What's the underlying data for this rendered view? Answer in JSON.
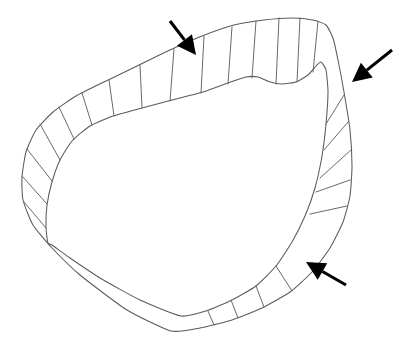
{
  "figure": {
    "caption": "",
    "background_color": "#ffffff",
    "line_color": "#5a5a5a",
    "rib_color": "#6a6a6a",
    "arrow_color": "#000000",
    "canvas": {
      "width": 407,
      "height": 349
    }
  },
  "geometry": {
    "outer_contour": {
      "name": "outer-boundary",
      "closed": true,
      "points": [
        [
          171,
          331
        ],
        [
          127,
          310
        ],
        [
          80,
          275
        ],
        [
          52,
          248
        ],
        [
          33,
          225
        ],
        [
          23,
          200
        ],
        [
          22,
          177
        ],
        [
          26,
          152
        ],
        [
          36,
          130
        ],
        [
          53,
          112
        ],
        [
          76,
          96
        ],
        [
          104,
          82
        ],
        [
          137,
          66
        ],
        [
          170,
          50
        ],
        [
          202,
          36
        ],
        [
          234,
          25
        ],
        [
          264,
          20
        ],
        [
          292,
          18
        ],
        [
          313,
          20
        ],
        [
          326,
          25
        ],
        [
          333,
          38
        ],
        [
          338,
          60
        ],
        [
          344,
          92
        ],
        [
          350,
          130
        ],
        [
          352,
          166
        ],
        [
          350,
          196
        ],
        [
          343,
          222
        ],
        [
          330,
          248
        ],
        [
          312,
          272
        ],
        [
          290,
          292
        ],
        [
          262,
          308
        ],
        [
          232,
          320
        ],
        [
          200,
          328
        ]
      ]
    },
    "inner_contour": {
      "name": "inner-boundary",
      "closed": true,
      "points": [
        [
          181,
          316
        ],
        [
          140,
          300
        ],
        [
          100,
          278
        ],
        [
          70,
          258
        ],
        [
          52,
          245
        ],
        [
          48,
          243
        ],
        [
          46,
          228
        ],
        [
          47,
          205
        ],
        [
          52,
          182
        ],
        [
          60,
          160
        ],
        [
          72,
          141
        ],
        [
          90,
          126
        ],
        [
          113,
          116
        ],
        [
          142,
          108
        ],
        [
          172,
          100
        ],
        [
          203,
          92
        ],
        [
          228,
          83
        ],
        [
          246,
          77
        ],
        [
          258,
          77
        ],
        [
          270,
          82
        ],
        [
          282,
          84
        ],
        [
          296,
          82
        ],
        [
          308,
          75
        ],
        [
          316,
          66
        ],
        [
          321,
          62
        ],
        [
          326,
          70
        ],
        [
          328,
          92
        ],
        [
          326,
          124
        ],
        [
          322,
          156
        ],
        [
          315,
          188
        ],
        [
          305,
          216
        ],
        [
          292,
          242
        ],
        [
          276,
          266
        ],
        [
          256,
          286
        ],
        [
          232,
          300
        ],
        [
          206,
          311
        ]
      ]
    },
    "rib_lines": [
      {
        "name": "rib-top-1",
        "x1": 232,
        "y1": 27,
        "x2": 228,
        "y2": 84
      },
      {
        "name": "rib-top-2",
        "x1": 256,
        "y1": 21,
        "x2": 252,
        "y2": 78
      },
      {
        "name": "rib-top-3",
        "x1": 279,
        "y1": 18,
        "x2": 276,
        "y2": 84
      },
      {
        "name": "rib-top-4",
        "x1": 300,
        "y1": 18,
        "x2": 297,
        "y2": 82
      },
      {
        "name": "rib-top-5",
        "x1": 318,
        "y1": 21,
        "x2": 313,
        "y2": 72
      },
      {
        "name": "rib-top-6",
        "x1": 204,
        "y1": 36,
        "x2": 201,
        "y2": 93
      },
      {
        "name": "rib-upper-left-1",
        "x1": 174,
        "y1": 49,
        "x2": 170,
        "y2": 101
      },
      {
        "name": "rib-upper-left-2",
        "x1": 140,
        "y1": 65,
        "x2": 142,
        "y2": 108
      },
      {
        "name": "rib-upper-left-3",
        "x1": 109,
        "y1": 80,
        "x2": 114,
        "y2": 116
      },
      {
        "name": "rib-upper-left-4",
        "x1": 82,
        "y1": 93,
        "x2": 92,
        "y2": 125
      },
      {
        "name": "rib-upper-left-5",
        "x1": 59,
        "y1": 107,
        "x2": 74,
        "y2": 139
      },
      {
        "name": "rib-left-1",
        "x1": 40,
        "y1": 124,
        "x2": 60,
        "y2": 160
      },
      {
        "name": "rib-left-2",
        "x1": 27,
        "y1": 149,
        "x2": 52,
        "y2": 181
      },
      {
        "name": "rib-left-3",
        "x1": 22,
        "y1": 176,
        "x2": 47,
        "y2": 204
      },
      {
        "name": "rib-left-4",
        "x1": 24,
        "y1": 202,
        "x2": 46,
        "y2": 228
      },
      {
        "name": "rib-right-1",
        "x1": 344,
        "y1": 95,
        "x2": 326,
        "y2": 124
      },
      {
        "name": "rib-right-2",
        "x1": 348,
        "y1": 122,
        "x2": 324,
        "y2": 150
      },
      {
        "name": "rib-right-3",
        "x1": 351,
        "y1": 150,
        "x2": 320,
        "y2": 178
      },
      {
        "name": "rib-right-4",
        "x1": 350,
        "y1": 180,
        "x2": 316,
        "y2": 192
      },
      {
        "name": "rib-right-5",
        "x1": 347,
        "y1": 206,
        "x2": 310,
        "y2": 214
      },
      {
        "name": "rib-bottom-1",
        "x1": 238,
        "y1": 318,
        "x2": 231,
        "y2": 300
      },
      {
        "name": "rib-bottom-2",
        "x1": 264,
        "y1": 307,
        "x2": 256,
        "y2": 286
      },
      {
        "name": "rib-bottom-3",
        "x1": 292,
        "y1": 291,
        "x2": 276,
        "y2": 266
      },
      {
        "name": "rib-bottom-4",
        "x1": 214,
        "y1": 325,
        "x2": 208,
        "y2": 311
      }
    ]
  },
  "annotations": {
    "arrows": [
      {
        "name": "annotation-arrow-top-left",
        "label": "",
        "direction": "down-right",
        "tail": [
          170,
          21
        ],
        "tip": [
          196,
          55
        ]
      },
      {
        "name": "annotation-arrow-right",
        "label": "",
        "direction": "down-left",
        "tail": [
          392,
          50
        ],
        "tip": [
          352,
          82
        ]
      },
      {
        "name": "annotation-arrow-bottom-right",
        "label": "",
        "direction": "up-left",
        "tail": [
          346,
          285
        ],
        "tip": [
          306,
          262
        ]
      }
    ],
    "arrow_count": 3
  }
}
